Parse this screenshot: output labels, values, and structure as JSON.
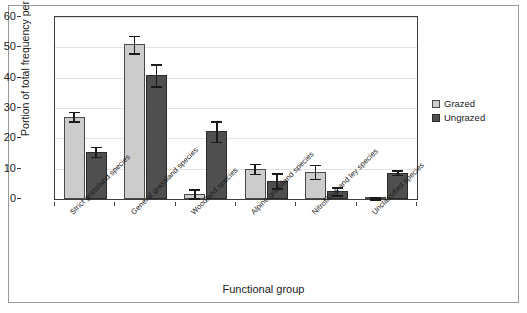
{
  "chart_data": {
    "type": "bar",
    "title": "",
    "xlabel": "Functional group",
    "ylabel": "Portion of total frequency per plot[%]",
    "ylim": [
      0,
      60
    ],
    "ytick_labels": [
      "0",
      "10",
      "20",
      "30",
      "40",
      "50",
      "60"
    ],
    "ytick_values": [
      0,
      10,
      20,
      30,
      40,
      50,
      60
    ],
    "grid": "horizontal",
    "legend_position": "right",
    "categories": [
      "Strict grassland species",
      "General grassland species",
      "Woodland species",
      "Alpine grassland species",
      "Nitrofilous and ley species",
      "Unclassified species"
    ],
    "series": [
      {
        "name": "Grazed",
        "color": "#cccccc",
        "values": [
          27.2,
          51.0,
          1.7,
          10.0,
          9.0,
          0.3
        ],
        "errors": [
          1.6,
          2.9,
          1.5,
          1.7,
          2.3,
          0.3
        ]
      },
      {
        "name": "Ungrazed",
        "color": "#4f4f4f",
        "values": [
          15.6,
          40.8,
          22.3,
          6.0,
          2.5,
          8.7
        ],
        "errors": [
          1.7,
          3.7,
          3.4,
          2.5,
          1.3,
          0.7
        ]
      }
    ]
  },
  "legend": {
    "entries": [
      {
        "label": "Grazed",
        "swatch": "grazed-swatch"
      },
      {
        "label": "Ungrazed",
        "swatch": "ungrazed-swatch"
      }
    ]
  }
}
